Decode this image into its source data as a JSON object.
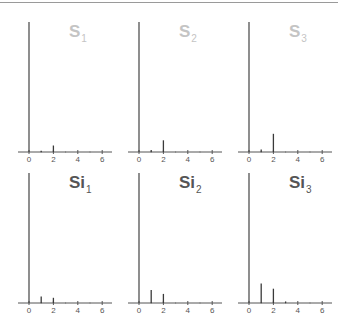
{
  "figure": {
    "colors": {
      "axis": "#555555",
      "bar": "#3a3a3a",
      "title_top": "#c4c4c4",
      "title_bottom": "#555555",
      "border": "#9a9a9a"
    }
  },
  "chart_data": [
    {
      "type": "bar",
      "title": "S",
      "subscript": "1",
      "row": "top",
      "x": [
        0,
        1,
        2,
        3,
        4,
        5,
        6
      ],
      "values": [
        1.0,
        0.01,
        0.05,
        0,
        0,
        0,
        0
      ],
      "xticks": [
        "0",
        "2",
        "4",
        "6"
      ],
      "xlim": [
        -0.5,
        6.8
      ],
      "ylim": [
        0,
        1.0
      ],
      "grid": false
    },
    {
      "type": "bar",
      "title": "S",
      "subscript": "2",
      "row": "top",
      "x": [
        0,
        1,
        2,
        3,
        4,
        5,
        6
      ],
      "values": [
        1.0,
        0.015,
        0.09,
        0,
        0,
        0,
        0
      ],
      "xticks": [
        "0",
        "2",
        "4",
        "6"
      ],
      "xlim": [
        -0.5,
        6.8
      ],
      "ylim": [
        0,
        1.0
      ],
      "grid": false
    },
    {
      "type": "bar",
      "title": "S",
      "subscript": "3",
      "row": "top",
      "x": [
        0,
        1,
        2,
        3,
        4,
        5,
        6
      ],
      "values": [
        1.0,
        0.02,
        0.14,
        0,
        0,
        0,
        0
      ],
      "xticks": [
        "0",
        "2",
        "4",
        "6"
      ],
      "xlim": [
        -0.5,
        6.8
      ],
      "ylim": [
        0,
        1.0
      ],
      "grid": false
    },
    {
      "type": "bar",
      "title": "Si",
      "subscript": "1",
      "row": "bottom",
      "x": [
        0,
        1,
        2,
        3,
        4,
        5,
        6
      ],
      "values": [
        1.0,
        0.05,
        0.04,
        0,
        0,
        0,
        0
      ],
      "xticks": [
        "0",
        "2",
        "4",
        "6"
      ],
      "xlim": [
        -0.5,
        6.8
      ],
      "ylim": [
        0,
        1.0
      ],
      "grid": false
    },
    {
      "type": "bar",
      "title": "Si",
      "subscript": "2",
      "row": "bottom",
      "x": [
        0,
        1,
        2,
        3,
        4,
        5,
        6
      ],
      "values": [
        1.0,
        0.1,
        0.07,
        0,
        0,
        0,
        0
      ],
      "xticks": [
        "0",
        "2",
        "4",
        "6"
      ],
      "xlim": [
        -0.5,
        6.8
      ],
      "ylim": [
        0,
        1.0
      ],
      "grid": false
    },
    {
      "type": "bar",
      "title": "Si",
      "subscript": "3",
      "row": "bottom",
      "x": [
        0,
        1,
        2,
        3,
        4,
        5,
        6
      ],
      "values": [
        1.0,
        0.15,
        0.11,
        0.012,
        0,
        0,
        0
      ],
      "xticks": [
        "0",
        "2",
        "4",
        "6"
      ],
      "xlim": [
        -0.5,
        6.8
      ],
      "ylim": [
        0,
        1.0
      ],
      "grid": false
    }
  ]
}
